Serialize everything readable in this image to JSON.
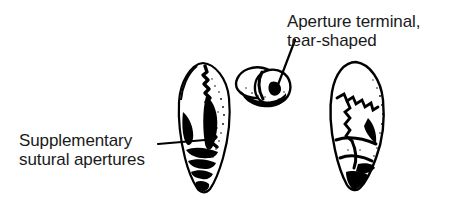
{
  "figure": {
    "background_color": "#ffffff",
    "ink_color": "#000000",
    "text_color": "#1a1a1a",
    "width": 454,
    "height": 214
  },
  "labels": {
    "aperture": {
      "name": "aperture-label",
      "line1": "Aperture terminal,",
      "line2": "tear-shaped",
      "leader": "leader-line-aperture"
    },
    "supplementary": {
      "name": "supplementary-label",
      "line1": "Supplementary",
      "line2": "sutural apertures",
      "leader": "leader-line-supplementary"
    }
  },
  "specimens": [
    {
      "name": "specimen-left-side-view",
      "view": "side view",
      "feature": "supplementary sutural apertures"
    },
    {
      "name": "specimen-middle-apertural-view",
      "view": "apertural view",
      "feature": "terminal tear-shaped aperture"
    },
    {
      "name": "specimen-right-side-view",
      "view": "opposite side view",
      "feature": "zigzag sutures"
    }
  ]
}
